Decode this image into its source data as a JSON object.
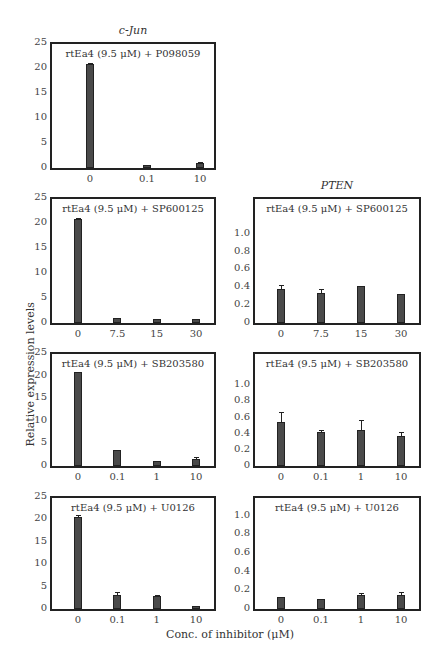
{
  "chart_data": [
    {
      "type": "bar",
      "gene": "c-Jun",
      "title": "rtEa4 (9.5 μM) + P098059",
      "categories": [
        "0",
        "0.1",
        "10"
      ],
      "values": [
        20.8,
        0.7,
        1.0
      ],
      "errors": [
        0.3,
        0.1,
        0.2
      ],
      "ylim": [
        0,
        25
      ],
      "yticks": [
        "25",
        "20",
        "15",
        "10",
        "5",
        "0"
      ]
    },
    {
      "type": "bar",
      "gene": "c-Jun",
      "title": "rtEa4 (9.5 μM) + SP600125",
      "categories": [
        "0",
        "7.5",
        "15",
        "30"
      ],
      "values": [
        20.8,
        1.1,
        0.9,
        0.8
      ],
      "errors": [
        0.2,
        0.1,
        0.1,
        0.1
      ],
      "ylim": [
        0,
        25
      ],
      "yticks": [
        "25",
        "20",
        "15",
        "10",
        "5",
        "0"
      ]
    },
    {
      "type": "bar",
      "gene": "PTEN",
      "title": "rtEa4 (9.5 μM) + SP600125",
      "categories": [
        "0",
        "7.5",
        "15",
        "30"
      ],
      "values": [
        0.38,
        0.34,
        0.41,
        0.32
      ],
      "errors": [
        0.05,
        0.04,
        0.01,
        0.01
      ],
      "ylim": [
        0,
        1.4
      ],
      "yticks": [
        "1.0",
        "0.8",
        "0.6",
        "0.4",
        "0.2",
        "0"
      ]
    },
    {
      "type": "bar",
      "gene": "c-Jun",
      "title": "rtEa4 (9.5 μM) + SB203580",
      "categories": [
        "0",
        "0.1",
        "1",
        "10"
      ],
      "values": [
        20.8,
        3.5,
        1.0,
        1.5
      ],
      "errors": [
        0.2,
        0.1,
        0.2,
        0.4
      ],
      "ylim": [
        0,
        25
      ],
      "yticks": [
        "25",
        "20",
        "15",
        "10",
        "5",
        "0"
      ]
    },
    {
      "type": "bar",
      "gene": "PTEN",
      "title": "rtEa4 (9.5 μM) + SB203580",
      "categories": [
        "0",
        "0.1",
        "1",
        "10"
      ],
      "values": [
        0.55,
        0.42,
        0.44,
        0.37
      ],
      "errors": [
        0.12,
        0.02,
        0.13,
        0.05
      ],
      "ylim": [
        0,
        1.4
      ],
      "yticks": [
        "1.0",
        "0.8",
        "0.6",
        "0.4",
        "0.2",
        "0"
      ]
    },
    {
      "type": "bar",
      "gene": "c-Jun",
      "title": "rtEa4 (9.5 μM) + U0126",
      "categories": [
        "0",
        "0.1",
        "1",
        "10"
      ],
      "values": [
        20.6,
        3.2,
        2.8,
        0.6
      ],
      "errors": [
        0.3,
        0.7,
        0.4,
        0.1
      ],
      "ylim": [
        0,
        25
      ],
      "yticks": [
        "25",
        "20",
        "15",
        "10",
        "5",
        "0"
      ]
    },
    {
      "type": "bar",
      "gene": "PTEN",
      "title": "rtEa4 (9.5 μM) + U0126",
      "categories": [
        "0",
        "0.1",
        "1",
        "10"
      ],
      "values": [
        0.13,
        0.11,
        0.15,
        0.15
      ],
      "errors": [
        0.01,
        0.01,
        0.02,
        0.03
      ],
      "ylim": [
        0,
        1.2
      ],
      "yticks": [
        "1.0",
        "0.8",
        "0.6",
        "0.4",
        "0.2",
        "0"
      ]
    }
  ],
  "labels": {
    "gene_left": "c-Jun",
    "gene_right": "PTEN",
    "ylabel": "Relative expression levels",
    "xlabel": "Conc. of inhibitor (μM)"
  },
  "panels_meta": [
    {
      "left": 50,
      "top": 42,
      "width": 166,
      "height": 128
    },
    {
      "left": 50,
      "top": 197,
      "width": 166,
      "height": 128
    },
    {
      "left": 253,
      "top": 197,
      "width": 168,
      "height": 128
    },
    {
      "left": 50,
      "top": 352,
      "width": 166,
      "height": 116
    },
    {
      "left": 253,
      "top": 352,
      "width": 168,
      "height": 116
    },
    {
      "left": 50,
      "top": 496,
      "width": 166,
      "height": 115
    },
    {
      "left": 253,
      "top": 496,
      "width": 168,
      "height": 115
    }
  ]
}
